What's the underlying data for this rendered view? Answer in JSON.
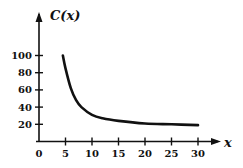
{
  "chart_data": {
    "type": "line",
    "title": "",
    "xlabel": "x",
    "ylabel": "C(x)",
    "xlim": [
      0,
      30
    ],
    "ylim": [
      0,
      100
    ],
    "xticks": [
      0,
      5,
      10,
      15,
      20,
      25,
      30
    ],
    "yticks": [
      20,
      40,
      60,
      80,
      100
    ],
    "grid": false,
    "legend": null,
    "series": [
      {
        "name": "C(x)",
        "x": [
          4.5,
          5,
          6,
          7,
          8,
          10,
          12,
          15,
          20,
          25,
          30
        ],
        "y": [
          100,
          85,
          62,
          48,
          40,
          31,
          27,
          24,
          21,
          20,
          19
        ]
      }
    ]
  },
  "labels": {
    "y_axis": "C(x)",
    "x_axis": "x",
    "x_ticks": [
      "0",
      "5",
      "10",
      "15",
      "20",
      "25",
      "30"
    ],
    "y_ticks": [
      "20",
      "40",
      "60",
      "80",
      "100"
    ]
  },
  "colors": {
    "curve": "#111111",
    "axis": "#111111",
    "background": "#ffffff"
  }
}
